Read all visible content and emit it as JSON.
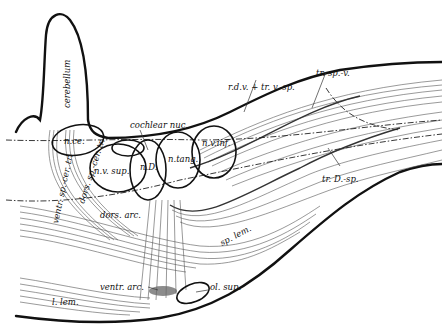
{
  "diagram": {
    "labels": {
      "cerebellum": "cerebellum",
      "cochlear_nuc": "cochlear nuc.",
      "rdv_trvsp": "r.d.v. + tr. v.-sp.",
      "tr_sp_v": "tr. sp.-v.",
      "n_ce": "n.ce.",
      "n_v_sup": "n.v. sup.",
      "n_D": "n.D.",
      "n_tang": "n.tang.",
      "n_v_inf": "n.v.inf.",
      "tr_D_sp": "tr. D.-sp.",
      "dors_arc": "dors. arc.",
      "sp_lem": "sp. lem.",
      "ventr_sp_cer_tr": "ventr. sp.-cer. tr.",
      "dors_sp_cer_tr": "dors. sp.-cer. tr.",
      "ventr_arc": "ventr. arc.",
      "ol_sup": "ol. sup.",
      "l_lem": "l. lem."
    }
  }
}
